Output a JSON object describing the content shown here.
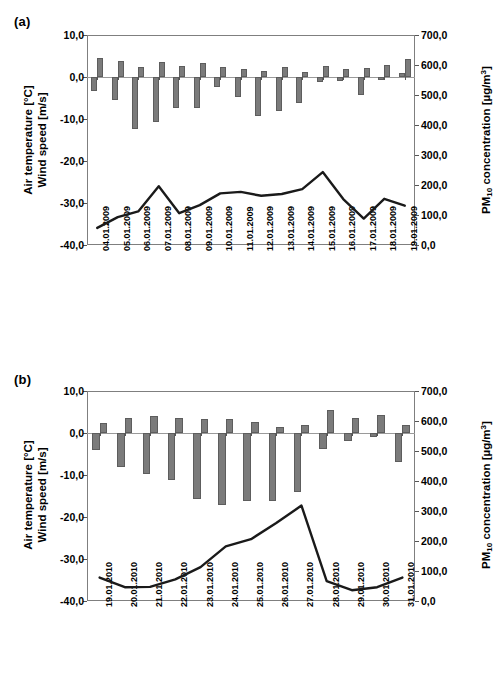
{
  "figure": {
    "panels": [
      {
        "tag": "(a)",
        "y_left_label_line1": "Air temperature [°C]",
        "y_left_label_line2": "Wind speed [m/s]",
        "y_right_label": "PM10 concentration [µg/m3]",
        "chart_data": {
          "type": "bar",
          "title": "(a)",
          "xlabel": "",
          "ylabel": "Air temperature [°C] / Wind speed [m/s]",
          "y2label": "PM10 concentration [µg/m3]",
          "ylim": [
            -40.0,
            10.0
          ],
          "y2lim": [
            0.0,
            700.0
          ],
          "yticks": [
            "10,0",
            "0,0",
            "-10,0",
            "-20,0",
            "-30,0",
            "-40,0"
          ],
          "ytick_values": [
            10.0,
            0.0,
            -10.0,
            -20.0,
            -30.0,
            -40.0
          ],
          "y2ticks": [
            "700,0",
            "600,0",
            "500,0",
            "400,0",
            "300,0",
            "200,0",
            "100,0",
            "0,0"
          ],
          "y2tick_values": [
            700.0,
            600.0,
            500.0,
            400.0,
            300.0,
            200.0,
            100.0,
            0.0
          ],
          "grid": false,
          "legend": "none",
          "categories": [
            "04.01.2009",
            "05.01.2009",
            "06.01.2009",
            "07.01.2009",
            "08.01.2009",
            "09.01.2009",
            "10.01.2009",
            "11.01.2009",
            "12.01.2009",
            "13.01.2009",
            "14.01.2009",
            "15.01.2009",
            "16.01.2009",
            "17.01.2009",
            "18.01.2009",
            "19.01.2009"
          ],
          "series": [
            {
              "name": "Air temperature [°C]",
              "kind": "bar",
              "axis": "left",
              "values": [
                -3.4,
                -5.5,
                -12.3,
                -10.8,
                -7.3,
                -7.4,
                -2.3,
                -4.7,
                -9.3,
                -8.0,
                -6.2,
                -1.2,
                -0.9,
                -4.2,
                -0.7,
                1.0
              ]
            },
            {
              "name": "Wind speed [m/s]",
              "kind": "bar",
              "axis": "left",
              "values": [
                4.6,
                3.7,
                2.3,
                3.5,
                2.6,
                3.4,
                2.3,
                1.8,
                1.5,
                2.3,
                1.2,
                2.7,
                1.9,
                2.1,
                2.8,
                4.2
              ]
            },
            {
              "name": "PM10 concentration [µg/m3]",
              "kind": "line",
              "axis": "right",
              "values": [
                57,
                93,
                112,
                196,
                106,
                133,
                172,
                177,
                164,
                170,
                186,
                243,
                153,
                88,
                154,
                131
              ]
            }
          ]
        }
      },
      {
        "tag": "(b)",
        "y_left_label_line1": "Air temperature [°C]",
        "y_left_label_line2": "Wind speed [m/s]",
        "y_right_label": "PM10 concentration [µg/m3]",
        "chart_data": {
          "type": "bar",
          "title": "(b)",
          "xlabel": "",
          "ylabel": "Air temperature [°C] / Wind speed [m/s]",
          "y2label": "PM10 concentration [µg/m3]",
          "ylim": [
            -40.0,
            10.0
          ],
          "y2lim": [
            0.0,
            700.0
          ],
          "yticks": [
            "10,0",
            "0,0",
            "-10,0",
            "-20,0",
            "-30,0",
            "-40,0"
          ],
          "ytick_values": [
            10.0,
            0.0,
            -10.0,
            -20.0,
            -30.0,
            -40.0
          ],
          "y2ticks": [
            "700,0",
            "600,0",
            "500,0",
            "400,0",
            "300,0",
            "200,0",
            "100,0",
            "0,0"
          ],
          "y2tick_values": [
            700.0,
            600.0,
            500.0,
            400.0,
            300.0,
            200.0,
            100.0,
            0.0
          ],
          "grid": false,
          "legend": "none",
          "categories": [
            "19.01.2010",
            "20.01.2010",
            "21.01.2010",
            "22.01.2010",
            "23.01.2010",
            "24.01.2010",
            "25.01.2010",
            "26.01.2010",
            "27.01.2010",
            "28.01.2010",
            "29.01.2010",
            "30.01.2010",
            "31.01.2010"
          ],
          "series": [
            {
              "name": "Air temperature [°C]",
              "kind": "bar",
              "axis": "left",
              "values": [
                -4.1,
                -8.2,
                -9.7,
                -11.3,
                -15.8,
                -17.1,
                -16.2,
                -16.3,
                -14.0,
                -3.7,
                -1.8,
                -0.9,
                -6.9
              ]
            },
            {
              "name": "Wind speed [m/s]",
              "kind": "bar",
              "axis": "left",
              "values": [
                2.4,
                3.6,
                4.0,
                3.5,
                3.3,
                3.3,
                2.6,
                1.5,
                1.8,
                5.5,
                3.6,
                4.2,
                1.9
              ]
            },
            {
              "name": "PM10 concentration [µg/m3]",
              "kind": "line",
              "axis": "right",
              "values": [
                78,
                46,
                47,
                72,
                113,
                182,
                206,
                260,
                318,
                66,
                36,
                46,
                78
              ]
            }
          ]
        }
      }
    ]
  }
}
